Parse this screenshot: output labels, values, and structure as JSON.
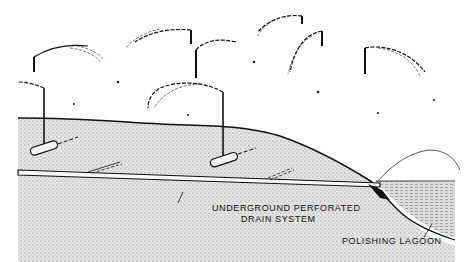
{
  "diagram": {
    "type": "cross-section illustration",
    "labels": {
      "drain_line1": "UNDERGROUND PERFORATED",
      "drain_line2": "DRAIN SYSTEM",
      "lagoon": "POLISHING LAGOON"
    },
    "components": [
      {
        "name": "sprinkler-heads",
        "count": 7
      },
      {
        "name": "lateral-pipes",
        "count": 2
      },
      {
        "name": "underground-perforated-drain",
        "count": 1
      },
      {
        "name": "polishing-lagoon",
        "count": 1
      }
    ],
    "colors": {
      "line": "#111111",
      "soil_fill": "#d9d9d9",
      "water_fill": "#cfcfcf",
      "background": "#ffffff"
    }
  }
}
